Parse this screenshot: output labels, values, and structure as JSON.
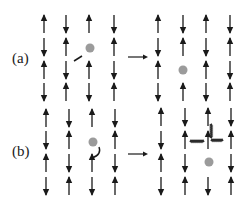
{
  "panels": [
    {
      "label": "(a)",
      "label_pos": [
        14,
        60
      ],
      "arrow_y": 57,
      "left": {
        "cols": [
          44,
          66,
          89,
          114
        ],
        "rows": [
          24,
          47,
          70,
          92
        ],
        "spins": [
          [
            "up",
            "down",
            "up",
            "down"
          ],
          [
            "down",
            "up",
            "down",
            "up"
          ],
          [
            "up",
            "hole",
            "up",
            "down"
          ],
          [
            "down",
            "up",
            "down",
            "up"
          ]
        ],
        "hole": [
          90,
          48
        ],
        "hop": {
          "type": "straight",
          "from": [
            74,
            61
          ],
          "to": [
            82,
            56
          ]
        }
      },
      "right": {
        "cols": [
          158,
          183,
          206,
          230
        ],
        "rows": [
          24,
          47,
          70,
          92
        ],
        "spins": [
          [
            "up",
            "down",
            "up",
            "down"
          ],
          [
            "down",
            "up",
            "hole",
            "up"
          ],
          [
            "up",
            "down",
            "up",
            "down"
          ],
          [
            "down",
            "up",
            "down",
            "up"
          ]
        ],
        "hole": [
          183,
          70
        ]
      }
    },
    {
      "label": "(b)",
      "label_pos": [
        14,
        153
      ],
      "arrow_y": 154,
      "left": {
        "cols": [
          46,
          69,
          92,
          115
        ],
        "rows": [
          118,
          140,
          163,
          186
        ],
        "spins": [
          [
            "up",
            "down",
            "up",
            "down"
          ],
          [
            "down",
            "up",
            "down",
            "up"
          ],
          [
            "up",
            "hole",
            "up",
            "down"
          ],
          [
            "down",
            "up",
            "down",
            "up"
          ]
        ],
        "hole": [
          93,
          142
        ],
        "hop": {
          "type": "curved",
          "from": [
            92,
            158
          ],
          "to": [
            99,
            147
          ]
        }
      },
      "right": {
        "cols": [
          161,
          185,
          208,
          231
        ],
        "rows": [
          117,
          140,
          163,
          186
        ],
        "spins": [
          [
            "up",
            "down",
            "up",
            "down"
          ],
          [
            "down",
            "up",
            "down",
            "up"
          ],
          [
            "up",
            "up",
            "hole",
            "down"
          ],
          [
            "down",
            "up",
            "down",
            "up"
          ]
        ],
        "hole": [
          209,
          162
        ],
        "string": true
      }
    }
  ],
  "colors": {
    "ink": "#1a1a1a",
    "hole": "#8a8a8a",
    "string": "#2a2a2a"
  }
}
